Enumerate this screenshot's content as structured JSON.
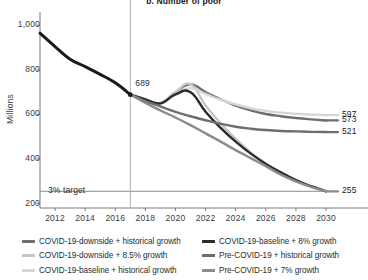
{
  "chart_data": {
    "type": "line",
    "title": "b. Number of poor",
    "xlabel": "",
    "ylabel": "Millions",
    "xlim": [
      2011,
      2030
    ],
    "ylim": [
      180,
      1060
    ],
    "grid": false,
    "legend_position": "bottom",
    "yticks": [
      "200",
      "400",
      "600",
      "800",
      "1,000"
    ],
    "ytick_values": [
      200,
      400,
      600,
      800,
      1000
    ],
    "xticks": [
      "2012",
      "2014",
      "2016",
      "2018",
      "2020",
      "2022",
      "2024",
      "2026",
      "2028",
      "2030"
    ],
    "xtick_values": [
      2012,
      2014,
      2016,
      2018,
      2020,
      2022,
      2024,
      2026,
      2028,
      2030
    ],
    "annotations": [
      {
        "name": "target-line-label",
        "text": "3% target",
        "x": 2011.4,
        "y": 255
      },
      {
        "name": "historical-endpoint-label",
        "text": "689",
        "x": 2017.2,
        "y": 735
      }
    ],
    "reference_lines": [
      {
        "name": "target-line",
        "orientation": "horizontal",
        "value": 255,
        "color": "#8c8c8c"
      },
      {
        "name": "projection-start-line",
        "orientation": "vertical",
        "value": 2017,
        "color": "#b0b0b0"
      }
    ],
    "markers": [
      {
        "name": "historical-endpoint-marker",
        "x": 2017,
        "y": 689,
        "color": "#1a1a1a"
      }
    ],
    "series": [
      {
        "name": "Historical",
        "color": "#1a1a1a",
        "width": 3.0,
        "in_legend": false,
        "x": [
          2011,
          2012,
          2013,
          2014,
          2015,
          2016,
          2017
        ],
        "values": [
          965,
          905,
          848,
          815,
          780,
          742,
          689
        ]
      },
      {
        "name": "COVID-19-downside + historical growth",
        "color": "#6e6e6e",
        "width": 2.4,
        "end_label": "573",
        "x": [
          2017,
          2018,
          2019,
          2020,
          2021,
          2022,
          2023,
          2024,
          2025,
          2026,
          2027,
          2028,
          2029,
          2030
        ],
        "values": [
          689,
          668,
          650,
          700,
          735,
          700,
          668,
          640,
          618,
          602,
          592,
          584,
          578,
          573
        ]
      },
      {
        "name": "COVID-19-downside + 8.5% growth",
        "color": "#c6c6c6",
        "width": 2.4,
        "end_label": "255",
        "x": [
          2017,
          2018,
          2019,
          2020,
          2021,
          2022,
          2023,
          2024,
          2025,
          2026,
          2027,
          2028,
          2029,
          2030
        ],
        "values": [
          689,
          668,
          650,
          700,
          736,
          640,
          560,
          490,
          430,
          380,
          340,
          305,
          278,
          255
        ]
      },
      {
        "name": "COVID-19-baseline + historical growth",
        "color": "#d6d6d6",
        "width": 2.4,
        "end_label": "597",
        "x": [
          2017,
          2018,
          2019,
          2020,
          2021,
          2022,
          2023,
          2024,
          2025,
          2026,
          2027,
          2028,
          2029,
          2030
        ],
        "values": [
          689,
          668,
          650,
          690,
          718,
          692,
          666,
          645,
          628,
          616,
          608,
          603,
          600,
          597
        ]
      },
      {
        "name": "COVID-19-baseline + 8% growth",
        "color": "#2b2b2b",
        "width": 2.4,
        "end_label": "255",
        "x": [
          2017,
          2018,
          2019,
          2020,
          2021,
          2022,
          2023,
          2024,
          2025,
          2026,
          2027,
          2028,
          2029,
          2030
        ],
        "values": [
          689,
          668,
          650,
          690,
          700,
          612,
          540,
          478,
          424,
          378,
          340,
          305,
          278,
          255
        ]
      },
      {
        "name": "Pre-COVID-19 + historical growth",
        "color": "#6e6e6e",
        "width": 2.4,
        "end_label": "521",
        "x": [
          2017,
          2018,
          2019,
          2020,
          2021,
          2022,
          2023,
          2024,
          2025,
          2026,
          2027,
          2028,
          2029,
          2030
        ],
        "values": [
          689,
          660,
          636,
          612,
          592,
          574,
          558,
          545,
          536,
          530,
          526,
          524,
          522,
          521
        ]
      },
      {
        "name": "Pre-COVID-19 + 7% growth",
        "color": "#8c8c8c",
        "width": 2.4,
        "end_label": "255",
        "x": [
          2017,
          2018,
          2019,
          2020,
          2021,
          2022,
          2023,
          2024,
          2025,
          2026,
          2027,
          2028,
          2029,
          2030
        ],
        "values": [
          689,
          652,
          618,
          586,
          552,
          515,
          478,
          440,
          404,
          368,
          330,
          300,
          275,
          255
        ]
      }
    ],
    "end_labels": [
      {
        "name": "end-label-597",
        "text": "597",
        "value": 597
      },
      {
        "name": "end-label-573",
        "text": "573",
        "value": 573
      },
      {
        "name": "end-label-521",
        "text": "521",
        "value": 521
      },
      {
        "name": "end-label-255",
        "text": "255",
        "value": 255
      }
    ],
    "legend": [
      {
        "label": "COVID-19-downside + historical growth",
        "color": "#6e6e6e"
      },
      {
        "label": "COVID-19-downside + 8.5% growth",
        "color": "#c6c6c6"
      },
      {
        "label": "COVID-19-baseline + historical growth",
        "color": "#d6d6d6"
      },
      {
        "label": "COVID-19-baseline + 8% growth",
        "color": "#2b2b2b"
      },
      {
        "label": "Pre-COVID-19 + historical growth",
        "color": "#6e6e6e"
      },
      {
        "label": "Pre-COVID-19 + 7% growth",
        "color": "#8c8c8c"
      }
    ]
  }
}
